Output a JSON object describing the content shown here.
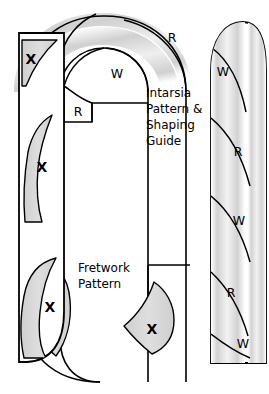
{
  "figure": {
    "name": "candy-cane-intarsia-shaping-diagram",
    "background_color": "#ffffff",
    "outline_color": "#000000",
    "fill_gray": "#d4d4d4",
    "band_gray": "#dcdcdc",
    "width": 269,
    "height": 394
  },
  "captions": {
    "intarsia": {
      "lines": [
        "Intarsia",
        "Pattern &",
        "Shaping",
        "Guide"
      ],
      "x": 146,
      "y": 93
    },
    "fretwork": {
      "lines": [
        "Fretwork",
        "Pattern"
      ],
      "x": 78,
      "y": 268
    }
  },
  "x_marks": [
    {
      "id": "x-left-top",
      "label": "X",
      "x": 31,
      "y": 60
    },
    {
      "id": "x-left-middle",
      "label": "X",
      "x": 42,
      "y": 168
    },
    {
      "id": "x-left-bottom",
      "label": "X",
      "x": 50,
      "y": 308
    },
    {
      "id": "x-bottom-right",
      "label": "X",
      "x": 152,
      "y": 330
    }
  ],
  "stripe_codes_arc": [
    {
      "id": "code-arc-r-inner",
      "label": "R",
      "x": 114,
      "y": 112
    },
    {
      "id": "code-arc-w-left",
      "label": "W",
      "x": 117,
      "y": 74
    },
    {
      "id": "code-arc-r-top",
      "label": "R",
      "x": 172,
      "y": 38
    },
    {
      "id": "code-arc-w-right",
      "label": "W",
      "x": 223,
      "y": 72
    }
  ],
  "stripe_codes_strip": [
    {
      "id": "code-strip-r-1",
      "label": "R",
      "x": 238,
      "y": 152
    },
    {
      "id": "code-strip-w-1",
      "label": "W",
      "x": 239,
      "y": 221
    },
    {
      "id": "code-strip-r-2",
      "label": "R",
      "x": 231,
      "y": 293
    },
    {
      "id": "code-strip-w-2",
      "label": "W",
      "x": 243,
      "y": 344
    }
  ],
  "legend_keys": {
    "R": "red stripe segment",
    "W": "white stripe segment",
    "X": "fretwork cut-out region"
  },
  "parts": [
    {
      "id": "left-fretwork-strip",
      "name": "left-fretwork-strip"
    },
    {
      "id": "cane-body",
      "name": "candy-cane-body"
    },
    {
      "id": "right-intarsia-strip",
      "name": "right-intarsia-strip"
    }
  ]
}
